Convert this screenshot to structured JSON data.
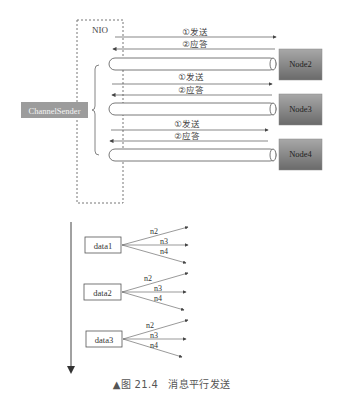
{
  "diagram": {
    "nio_label": "NIO",
    "sender_label": "ChannelSender",
    "send_label": "①发送",
    "reply_label": "②应答",
    "nodes": [
      {
        "label": "Node2",
        "y": 49
      },
      {
        "label": "Node3",
        "y": 94
      },
      {
        "label": "Node4",
        "y": 139
      }
    ],
    "colors": {
      "node_fill_top": "#9a9a9a",
      "node_fill_bottom": "#6e6e6e",
      "sender_fill": "#9c9c9c",
      "line": "#555555"
    }
  },
  "timeline": {
    "items": [
      {
        "label": "data1",
        "targets": [
          "n2",
          "n3",
          "n4"
        ]
      },
      {
        "label": "data2",
        "targets": [
          "n2",
          "n3",
          "n4"
        ]
      },
      {
        "label": "data3",
        "targets": [
          "n2",
          "n3",
          "n4"
        ]
      }
    ]
  },
  "caption": "▲图 21.4　消息平行发送"
}
